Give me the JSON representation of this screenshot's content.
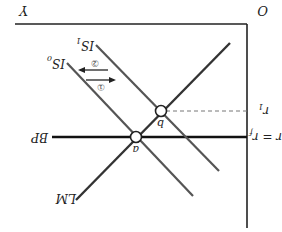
{
  "diagram": {
    "type": "IS-LM-BP",
    "orientation": "rotated 180 degrees",
    "origin_label": "O",
    "x_axis_label": "Y",
    "y_axis_labels": {
      "r1": "r",
      "r1_sub": "1",
      "rf": "r = r",
      "rf_sub": "f"
    },
    "curves": {
      "lm": "LM",
      "bp": "BP",
      "is0": "IS",
      "is0_sub": "0",
      "is1": "IS",
      "is1_sub": "1"
    },
    "points": {
      "a": "a",
      "b": "b"
    },
    "shifts": {
      "shift1": "①",
      "shift2": "②"
    },
    "colors": {
      "axis": "#222222",
      "lm": "#333333",
      "bp": "#111111",
      "is": "#555555",
      "dashed": "#777777"
    }
  }
}
